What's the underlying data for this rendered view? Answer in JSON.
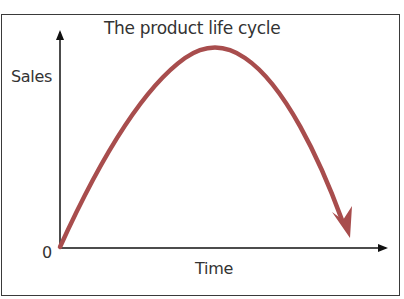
{
  "diagram": {
    "title": "The product life cycle",
    "y_axis_label": "Sales",
    "x_axis_label": "Time",
    "origin_label": "0",
    "curve": {
      "shape": "inverted-parabola",
      "description": "Sales rise from zero, peak, then decline",
      "color": "#a84d4d",
      "has_arrowhead": true
    },
    "axis_color": "#111111"
  }
}
